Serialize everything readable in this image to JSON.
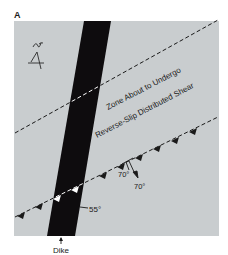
{
  "figure": {
    "panel_label": "A",
    "north_symbol": "north-arrow",
    "zone_label_line1": "Zone About to Undergo",
    "zone_label_line2": "Reverse-Slip Distributed Shear",
    "dike_label": "Dike",
    "dike_dip": "55°",
    "strike_dip_1": "70°",
    "strike_dip_2": "70°",
    "colors": {
      "background": "#ffffff",
      "map_fill": "#c9cdcf",
      "dike": "#0e0c0e",
      "lines": "#1a1a1a",
      "in_dike_marks": "#ffffff"
    }
  }
}
